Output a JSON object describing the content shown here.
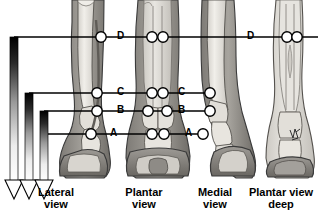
{
  "figure": {
    "background_color": "#ffffff",
    "line_color": "#000000",
    "marker_fill": "#ffffff",
    "marker_stroke": "#000000",
    "bone_light": "#e9e7e2",
    "bone_mid": "#c6c3bd",
    "tissue_dark": "#8d8a85",
    "tissue_darker": "#6e6b66",
    "outline": "#3a3a3a"
  },
  "levels": [
    {
      "id": "D",
      "label": "D",
      "y": 37
    },
    {
      "id": "C",
      "label": "C",
      "y": 93
    },
    {
      "id": "B",
      "label": "B",
      "y": 111
    },
    {
      "id": "A",
      "label": "A",
      "y": 134
    }
  ],
  "level_letters": [
    {
      "label": "D",
      "x": 117,
      "y": 31
    },
    {
      "label": "D",
      "x": 247,
      "y": 31
    },
    {
      "label": "C",
      "x": 117,
      "y": 87
    },
    {
      "label": "C",
      "x": 178,
      "y": 87
    },
    {
      "label": "B",
      "x": 117,
      "y": 105
    },
    {
      "label": "B",
      "x": 178,
      "y": 105
    },
    {
      "label": "A",
      "x": 110,
      "y": 128
    },
    {
      "label": "A",
      "x": 185,
      "y": 128
    }
  ],
  "markers": [
    {
      "level": "D",
      "cx": 101,
      "cy": 37,
      "r": 5.2
    },
    {
      "level": "D",
      "cx": 152,
      "cy": 37,
      "r": 5.2
    },
    {
      "level": "D",
      "cx": 163,
      "cy": 37,
      "r": 5.2
    },
    {
      "level": "D",
      "cx": 287,
      "cy": 37,
      "r": 5.2
    },
    {
      "level": "D",
      "cx": 297,
      "cy": 37,
      "r": 5.2
    },
    {
      "level": "C",
      "cx": 97,
      "cy": 93,
      "r": 5.2
    },
    {
      "level": "C",
      "cx": 152,
      "cy": 93,
      "r": 5.2
    },
    {
      "level": "C",
      "cx": 163,
      "cy": 93,
      "r": 5.2
    },
    {
      "level": "C",
      "cx": 210,
      "cy": 93,
      "r": 5.2
    },
    {
      "level": "B",
      "cx": 97,
      "cy": 111,
      "r": 5.2
    },
    {
      "level": "B",
      "cx": 148,
      "cy": 111,
      "r": 5.2
    },
    {
      "level": "B",
      "cx": 167,
      "cy": 111,
      "r": 5.2
    },
    {
      "level": "B",
      "cx": 210,
      "cy": 111,
      "r": 5.2
    },
    {
      "level": "A",
      "cx": 91,
      "cy": 134,
      "r": 5.2
    },
    {
      "level": "A",
      "cx": 152,
      "cy": 134,
      "r": 5.2
    },
    {
      "level": "A",
      "cx": 164,
      "cy": 134,
      "r": 5.2
    },
    {
      "level": "A",
      "cx": 203,
      "cy": 134,
      "r": 5.2
    }
  ],
  "arrows": [
    {
      "id": "arrow-d",
      "x": 14,
      "top": 37,
      "tip": 186,
      "label_source": "D"
    },
    {
      "id": "arrow-c",
      "x": 29,
      "top": 93,
      "tip": 186,
      "label_source": "C"
    },
    {
      "id": "arrow-b",
      "x": 44,
      "top": 111,
      "tip": 186,
      "label_source": "B"
    }
  ],
  "captions": [
    {
      "id": "lateral-view",
      "text": "Lateral\nview",
      "x": 56,
      "y": 189
    },
    {
      "id": "plantar-view",
      "text": "Plantar\nview",
      "x": 144,
      "y": 189
    },
    {
      "id": "medial-view",
      "text": "Medial\nview",
      "x": 215,
      "y": 189
    },
    {
      "id": "plantar-view-deep",
      "text": "Plantar view\ndeep",
      "x": 280,
      "y": 189
    }
  ],
  "artist_signature": {
    "present": true,
    "x": 294,
    "y": 136
  }
}
